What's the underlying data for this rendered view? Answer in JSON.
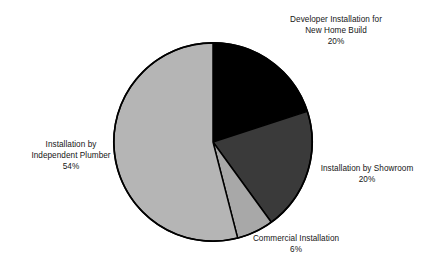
{
  "chart_data": {
    "type": "pie",
    "title": "",
    "subtitle": "",
    "xlabel": "",
    "ylabel": "",
    "legend_position": "none",
    "grid": false,
    "value_unit": "percent",
    "total": 100,
    "start_angle_deg": 0,
    "direction": "clockwise",
    "categories": [
      "Developer Installation for New Home Build",
      "Installation by Showroom",
      "Commercial Installation",
      "Installation by Independent Plumber"
    ],
    "values": [
      20,
      20,
      6,
      54
    ],
    "colors": [
      "#000000",
      "#3a3a3a",
      "#a8a8a8",
      "#b5b5b5"
    ],
    "slices": [
      {
        "id": "developer",
        "name": "Developer Installation for New Home Build",
        "value": 20,
        "percent_label": "20%",
        "color": "#000000",
        "start_deg": 0,
        "end_deg": 72
      },
      {
        "id": "showroom",
        "name": "Installation by Showroom",
        "value": 20,
        "percent_label": "20%",
        "color": "#3a3a3a",
        "start_deg": 72,
        "end_deg": 144
      },
      {
        "id": "commercial",
        "name": "Commercial Installation",
        "value": 6,
        "percent_label": "6%",
        "color": "#a8a8a8",
        "start_deg": 144,
        "end_deg": 165.6
      },
      {
        "id": "plumber",
        "name": "Installation by Independent Plumber",
        "value": 54,
        "percent_label": "54%",
        "color": "#b5b5b5",
        "start_deg": 165.6,
        "end_deg": 360
      }
    ]
  },
  "labels": {
    "developer": {
      "line1": "Developer Installation for",
      "line2": "New Home Build",
      "percent": "20%"
    },
    "showroom": {
      "line1": "Installation by Showroom",
      "percent": "20%"
    },
    "commercial": {
      "line1": "Commercial Installation",
      "percent": "6%"
    },
    "plumber": {
      "line1": "Installation by",
      "line2": "Independent Plumber",
      "percent": "54%"
    }
  },
  "style": {
    "background": "#ffffff",
    "outline": "#000000",
    "text": "#161616"
  }
}
